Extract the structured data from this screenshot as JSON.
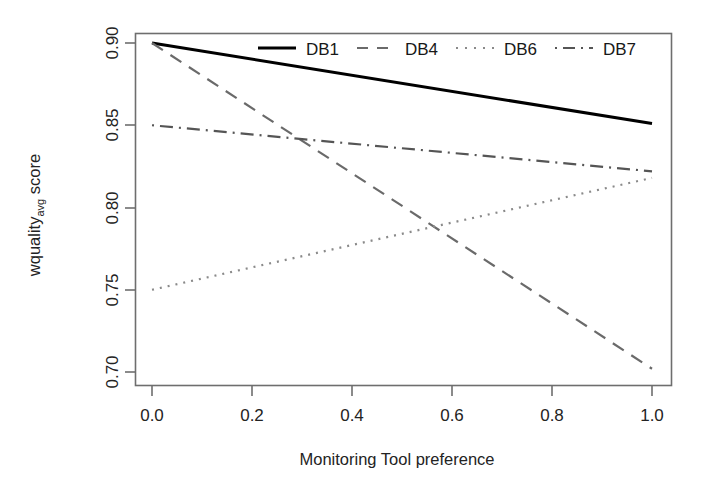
{
  "chart_data": {
    "type": "line",
    "title": "",
    "xlabel": "Monitoring Tool preference",
    "ylabel_main": "wquality",
    "ylabel_sub": "avg",
    "ylabel_tail": " score",
    "ylabel": "wqualityavg  score",
    "xlim": [
      0.0,
      1.0
    ],
    "ylim": [
      0.695,
      0.905
    ],
    "xticks": [
      0.0,
      0.2,
      0.4,
      0.6,
      0.8,
      1.0
    ],
    "xtick_labels": [
      "0.0",
      "0.2",
      "0.4",
      "0.6",
      "0.8",
      "1.0"
    ],
    "yticks": [
      0.7,
      0.75,
      0.8,
      0.85,
      0.9
    ],
    "ytick_labels": [
      "0.70",
      "0.75",
      "0.80",
      "0.85",
      "0.90"
    ],
    "grid": false,
    "legend_position": "top-inside",
    "x": [
      0.0,
      1.0
    ],
    "series": [
      {
        "name": "DB1",
        "values": [
          0.9,
          0.851
        ],
        "linestyle": "solid",
        "color": "#000000",
        "width": 3.0,
        "dasharray": ""
      },
      {
        "name": "DB4",
        "values": [
          0.9,
          0.702
        ],
        "linestyle": "dashed",
        "color": "#6a6a6a",
        "width": 2.2,
        "dasharray": "13,9"
      },
      {
        "name": "DB6",
        "values": [
          0.75,
          0.818
        ],
        "linestyle": "dotted",
        "color": "#8a8a8a",
        "width": 2.2,
        "dasharray": "2,6"
      },
      {
        "name": "DB7",
        "values": [
          0.85,
          0.822
        ],
        "linestyle": "dashdot",
        "color": "#555555",
        "width": 2.2,
        "dasharray": "2,6,13,6"
      }
    ],
    "intersections": [
      {
        "series": [
          "DB4",
          "DB7"
        ],
        "x": 0.305,
        "y": 0.842
      },
      {
        "series": [
          "DB4",
          "DB6"
        ],
        "x": 0.555,
        "y": 0.789
      }
    ]
  },
  "legend": {
    "entries": [
      {
        "label": "DB1",
        "style": "solid"
      },
      {
        "label": "DB4",
        "style": "dashed"
      },
      {
        "label": "DB6",
        "style": "dotted"
      },
      {
        "label": "DB7",
        "style": "dashdot"
      }
    ]
  }
}
